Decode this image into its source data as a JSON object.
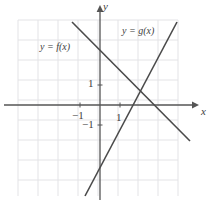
{
  "figure": {
    "kind": "coordinate-plane-two-lines",
    "colors": {
      "grid": "#e3e3e6",
      "axis": "#555555",
      "curve": "#4a4a4a",
      "text": "#3d3d3d",
      "background": "#ffffff"
    },
    "axes": {
      "y_axis_label": "y",
      "x_axis_label": "x",
      "origin_px": [
        100,
        105
      ],
      "unit_px": 20,
      "x_range": [
        -4.1,
        3.9
      ],
      "y_range": [
        -4.55,
        4.25
      ],
      "grid": true,
      "grid_cell_px": 20,
      "grid_left_px": 18,
      "grid_top_px": 20,
      "grid_right_px": 178,
      "grid_bottom_px": 196
    },
    "tick_labels": [
      {
        "text": "1",
        "axis": "y",
        "value": 1,
        "x_px": 88,
        "y_px": 78
      },
      {
        "text": "−1",
        "axis": "x",
        "value": -1,
        "x_px": 72,
        "y_px": 110
      },
      {
        "text": "−1",
        "axis": "y",
        "value": -1,
        "x_px": 82,
        "y_px": 119
      },
      {
        "text": "1",
        "axis": "x",
        "value": 1,
        "x_px": 116,
        "y_px": 112
      }
    ],
    "curves": [
      {
        "name": "f",
        "label": "y = f(x)",
        "label_x_px": 40,
        "label_y_px": 42,
        "slope": -1,
        "y_intercept": 2.4,
        "px_start": [
          72,
          22
        ],
        "px_end": [
          190,
          141
        ]
      },
      {
        "name": "g",
        "label": "y = g(x)",
        "label_x_px": 122,
        "label_y_px": 26,
        "slope": 1.9,
        "y_intercept": -1.45,
        "px_start": [
          85,
          196
        ],
        "px_end": [
          177,
          22
        ]
      }
    ],
    "intersection_px": [
      138,
      88
    ]
  },
  "chart_data": {
    "type": "line",
    "title": "",
    "xlabel": "x",
    "ylabel": "y",
    "xlim": [
      -4.1,
      3.9
    ],
    "ylim": [
      -4.55,
      4.25
    ],
    "grid": true,
    "legend_position": "inline-annotations",
    "annotations": [
      "y = f(x)",
      "y = g(x)"
    ],
    "tick_labels": {
      "x": [
        "-1",
        "1"
      ],
      "y": [
        "1",
        "-1"
      ]
    },
    "series": [
      {
        "name": "y = f(x)",
        "slope": -1,
        "intercept": 2.4,
        "x": [
          -1.4,
          4.5
        ],
        "values": [
          3.8,
          -1.8
        ]
      },
      {
        "name": "y = g(x)",
        "slope": 1.9,
        "intercept": -1.45,
        "x": [
          -0.75,
          3.85
        ],
        "values": [
          -4.55,
          4.15
        ]
      }
    ],
    "intersection": [
      1.9,
      0.5
    ]
  }
}
